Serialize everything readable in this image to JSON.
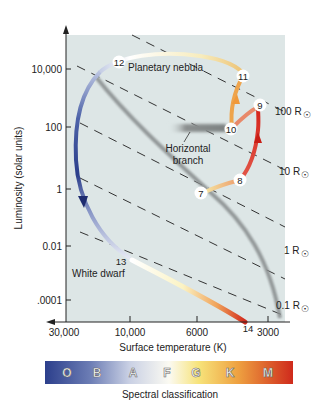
{
  "figure": {
    "type": "Hertzsprung-Russell diagram - evolutionary track of a Sun-like star",
    "y_axis": {
      "title": "Luminosity (solar units)",
      "ticks": [
        "10,000",
        "100",
        "1",
        "0.01",
        ".0001"
      ]
    },
    "x_axis": {
      "title": "Surface temperature (K)",
      "ticks": [
        "30,000",
        "10,000",
        "6000",
        "3000"
      ]
    },
    "radius_lines": [
      {
        "label": "100 R",
        "symbol": "☉"
      },
      {
        "label": "10 R",
        "symbol": "☉"
      },
      {
        "label": "1 R",
        "symbol": "☉"
      },
      {
        "label": "0.1 R",
        "symbol": "☉"
      }
    ],
    "annotations": {
      "planetary_nebula": "Planetary nebula",
      "horizontal_branch_line1": "Horizontal",
      "horizontal_branch_line2": "branch",
      "white_dwarf": "White dwarf"
    },
    "stages": [
      {
        "num": "7"
      },
      {
        "num": "8"
      },
      {
        "num": "9"
      },
      {
        "num": "10"
      },
      {
        "num": "11"
      },
      {
        "num": "12"
      },
      {
        "num": "13"
      },
      {
        "num": "14"
      }
    ],
    "spectral_bar": {
      "letters": [
        "O",
        "B",
        "A",
        "F",
        "G",
        "K",
        "M"
      ],
      "title": "Spectral classification"
    },
    "colors": {
      "plot_background": "#dde6e6",
      "main_sequence": "#8a8f90",
      "hot_blue": "#2d3f8c",
      "red": "#d42a1e",
      "orange": "#ee9a3a",
      "yellow": "#f7eab4"
    }
  }
}
